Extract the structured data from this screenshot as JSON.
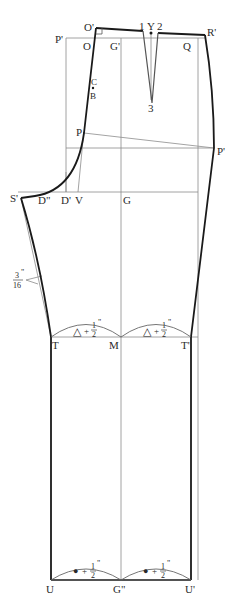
{
  "diagram": {
    "type": "trouser-front-pattern-draft",
    "colors": {
      "outline": "#1a1a1a",
      "guide": "#8c8c8c",
      "text": "#2a2a2a",
      "background": "#ffffff"
    },
    "points": {
      "O_prime": "O'",
      "P_prime_top": "P'",
      "O": "O",
      "G_prime": "G'",
      "one": "1",
      "Y": "Y",
      "two": "2",
      "Q": "Q",
      "R_prime": "R'",
      "C": "C",
      "B": "B",
      "three": "3",
      "P": "P",
      "P_prime_hip": "P'",
      "S_prime": "S'",
      "D_double_prime": "D\"",
      "D_prime": "D'",
      "V": "V",
      "G": "G",
      "T": "T",
      "M": "M",
      "T_prime": "T'",
      "U": "U",
      "G_double_prime": "G\"",
      "U_prime": "U'"
    },
    "annotations": {
      "seam_offset": {
        "numerator": "3",
        "denominator": "16",
        "unit": "\""
      },
      "knee_left": {
        "symbol": "△",
        "plus": "+",
        "numerator": "1",
        "denominator": "2",
        "unit": "\""
      },
      "knee_right": {
        "symbol": "△",
        "plus": "+",
        "numerator": "1",
        "denominator": "2",
        "unit": "\""
      },
      "hem_left": {
        "symbol": "●",
        "plus": "+",
        "numerator": "1",
        "denominator": "2",
        "unit": "\""
      },
      "hem_right": {
        "symbol": "●",
        "plus": "+",
        "numerator": "1",
        "denominator": "2",
        "unit": "\""
      }
    }
  }
}
